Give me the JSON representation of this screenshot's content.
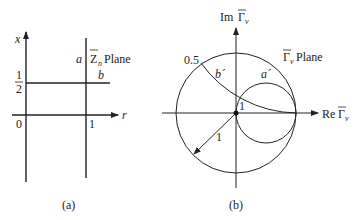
{
  "panel_a": {
    "caption": "(a)",
    "vertical_axis_label": "x",
    "horizontal_axis_label": "r",
    "origin_label": "0",
    "r_one_label": "1",
    "x_half_label": {
      "numerator": "1",
      "denominator": "2"
    },
    "line_a_label": "a",
    "line_b_label": "b",
    "plane_label": {
      "symbol": "Z",
      "subscript": "n",
      "text": "Plane"
    }
  },
  "panel_b": {
    "caption": "(b)",
    "vertical_axis_label": {
      "prefix": "Im",
      "symbol": "Γ",
      "subscript": "v"
    },
    "horizontal_axis_label": {
      "prefix": "Re",
      "symbol": "Γ",
      "subscript": "v"
    },
    "plane_label": {
      "symbol": "Γ",
      "subscript": "v",
      "text": "Plane"
    },
    "arc_a_label": "a´",
    "arc_b_label": "b´",
    "reactance_label": "0.5",
    "radius_label": "1",
    "intersection_label": "1"
  },
  "colors": {
    "stroke": "#222222",
    "background": "#ffffff"
  }
}
